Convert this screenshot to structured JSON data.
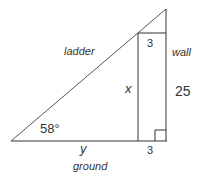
{
  "diagram": {
    "labels": {
      "ladder": "ladder",
      "wall": "wall",
      "ground": "ground",
      "x": "x",
      "y": "y",
      "angle": "58°",
      "wall_height": "25",
      "top_width": "3",
      "bottom_width": "3"
    },
    "colors": {
      "stroke": "#333333",
      "text": "#333333",
      "background": "#ffffff"
    }
  }
}
